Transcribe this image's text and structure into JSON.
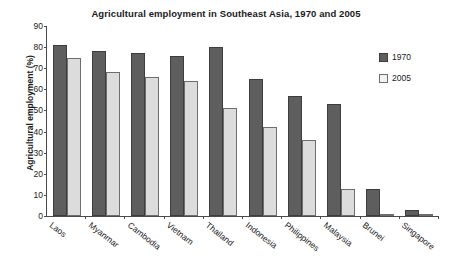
{
  "chart_data": {
    "type": "bar",
    "title": "Agricultural employment in Southeast Asia, 1970 and 2005",
    "xlabel": "",
    "ylabel": "Agricultural employment (%)",
    "ylim": [
      0,
      90
    ],
    "ytick_step": 10,
    "yticks": [
      0,
      10,
      20,
      30,
      40,
      50,
      60,
      70,
      80,
      90
    ],
    "grid": false,
    "legend_position": "right",
    "categories": [
      "Laos",
      "Myanmar",
      "Cambodia",
      "Vietnam",
      "Thailand",
      "Indonesia",
      "Philippines",
      "Malaysia",
      "Brunei",
      "Singapore"
    ],
    "series": [
      {
        "name": "1970",
        "color": "#5e5e5e",
        "values": [
          81,
          78,
          77,
          76,
          80,
          65,
          57,
          53,
          13,
          3
        ]
      },
      {
        "name": "2005",
        "color": "#dcdcdc",
        "values": [
          75,
          68,
          66,
          64,
          51,
          42,
          36,
          13,
          1,
          0.5
        ]
      }
    ]
  }
}
